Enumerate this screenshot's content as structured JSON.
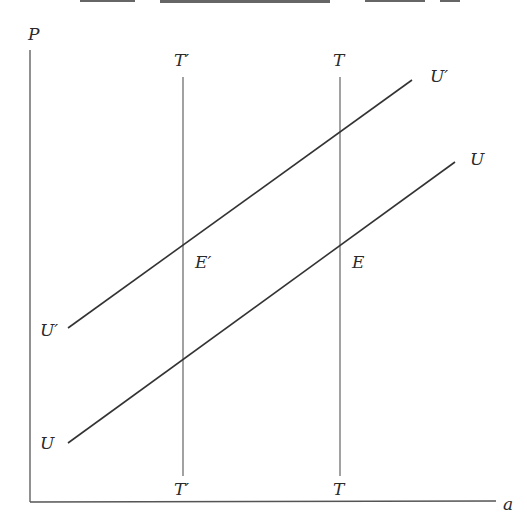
{
  "diagram": {
    "type": "economics-schedule-diagram",
    "axes": {
      "y_label": "P",
      "x_label": "a"
    },
    "vertical_lines": [
      {
        "id": "T-prime",
        "top_label": "T′",
        "bottom_label": "T′"
      },
      {
        "id": "T",
        "top_label": "T",
        "bottom_label": "T"
      }
    ],
    "sloped_lines": [
      {
        "id": "U-prime",
        "start_label": "U′",
        "end_label": "U′"
      },
      {
        "id": "U",
        "start_label": "U",
        "end_label": "U"
      }
    ],
    "equilibria": [
      {
        "id": "E-prime",
        "label": "E′",
        "at": [
          "T-prime",
          "U-prime"
        ]
      },
      {
        "id": "E",
        "label": "E",
        "at": [
          "T",
          "U"
        ]
      }
    ]
  }
}
